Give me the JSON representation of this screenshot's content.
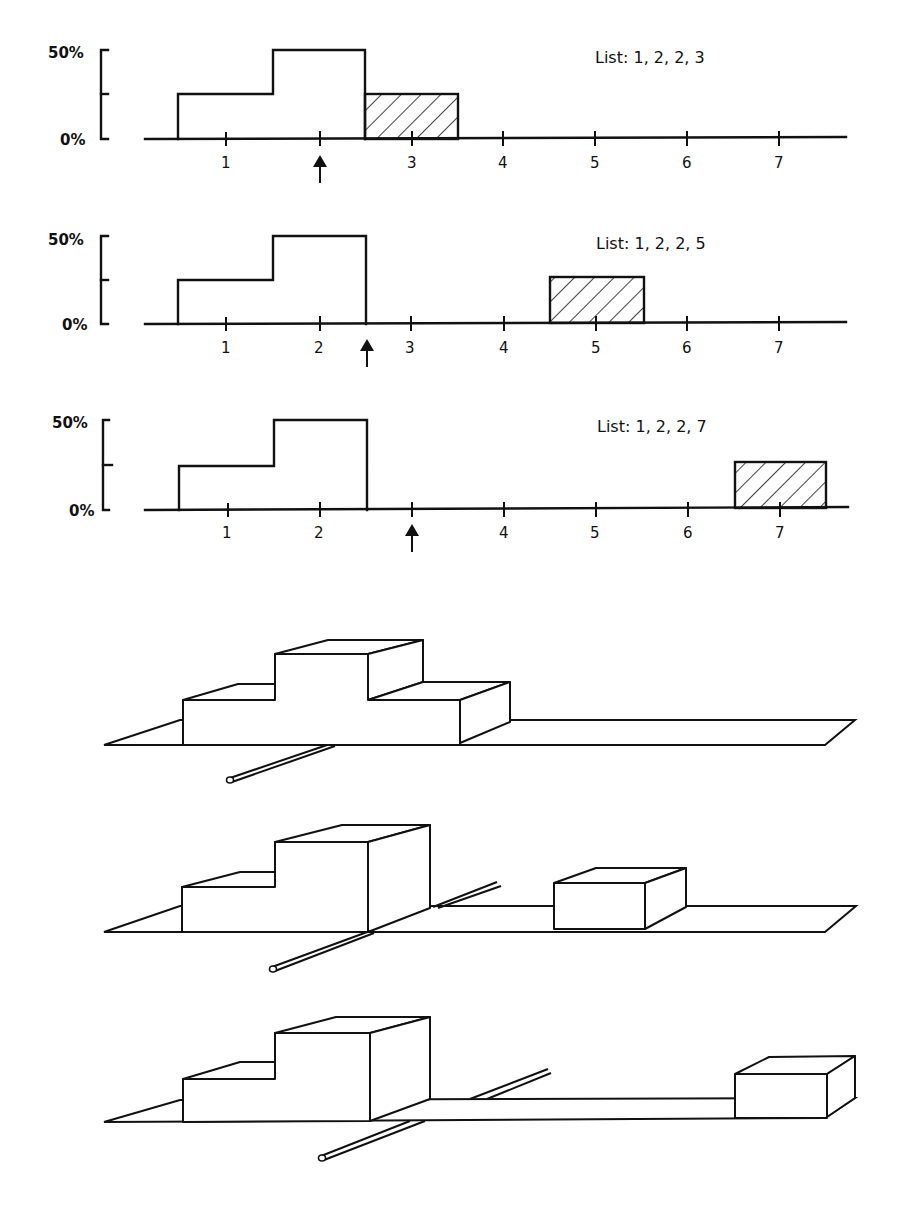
{
  "histograms": [
    {
      "list_label": "List: 1, 2, 2, 3",
      "values": [
        1,
        2,
        2,
        3
      ],
      "y_labels": [
        "50%",
        "0%"
      ],
      "x_ticks": [
        "1",
        "2",
        "3",
        "4",
        "5",
        "6",
        "7"
      ],
      "x_tick_labels_shown": [
        "1",
        "",
        "3",
        "4",
        "5",
        "6",
        "7"
      ],
      "bars": [
        {
          "x": 1,
          "percent": 25,
          "hatched": false
        },
        {
          "x": 2,
          "percent": 50,
          "hatched": false
        },
        {
          "x": 3,
          "percent": 25,
          "hatched": true
        }
      ],
      "mean_arrow_at": 2
    },
    {
      "list_label": "List: 1, 2, 2, 5",
      "values": [
        1,
        2,
        2,
        5
      ],
      "y_labels": [
        "50%",
        "0%"
      ],
      "x_ticks": [
        "1",
        "2",
        "3",
        "4",
        "5",
        "6",
        "7"
      ],
      "x_tick_labels_shown": [
        "1",
        "2",
        "3",
        "4",
        "5",
        "6",
        "7"
      ],
      "bars": [
        {
          "x": 1,
          "percent": 25,
          "hatched": false
        },
        {
          "x": 2,
          "percent": 50,
          "hatched": false
        },
        {
          "x": 5,
          "percent": 25,
          "hatched": true
        }
      ],
      "mean_arrow_at": 2.5
    },
    {
      "list_label": "List: 1, 2, 2, 7",
      "values": [
        1,
        2,
        2,
        7
      ],
      "y_labels": [
        "50%",
        "0%"
      ],
      "x_ticks": [
        "1",
        "2",
        "3",
        "4",
        "5",
        "6",
        "7"
      ],
      "x_tick_labels_shown": [
        "1",
        "2",
        "",
        "4",
        "5",
        "6",
        "7"
      ],
      "bars": [
        {
          "x": 1,
          "percent": 25,
          "hatched": false
        },
        {
          "x": 2,
          "percent": 50,
          "hatched": false
        },
        {
          "x": 7,
          "percent": 25,
          "hatched": true
        }
      ],
      "mean_arrow_at": 3
    }
  ],
  "models_3d": [
    {
      "list": "1, 2, 2, 3",
      "blocks": [
        1,
        2,
        3
      ],
      "rod_at": 2
    },
    {
      "list": "1, 2, 2, 5",
      "blocks": [
        1,
        2,
        5
      ],
      "rod_at": 2.5
    },
    {
      "list": "1, 2, 2, 7",
      "blocks": [
        1,
        2,
        7
      ],
      "rod_at": 3
    }
  ],
  "colors": {
    "ink": "#111111",
    "paper": "#ffffff"
  }
}
